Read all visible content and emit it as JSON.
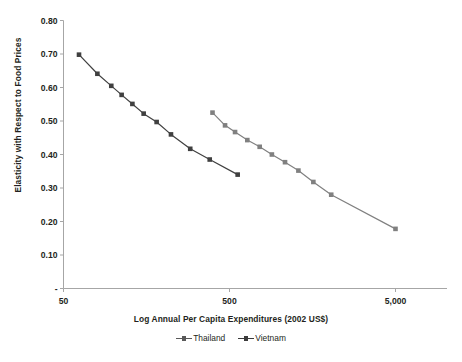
{
  "chart_data": {
    "type": "line",
    "title": "",
    "xlabel": "Log Annual Per Capita Expenditures (2002 US$)",
    "ylabel": "Elasticity with Respect to Food Prices",
    "xscale": "log",
    "xlim": [
      50,
      7000
    ],
    "ylim": [
      0,
      0.8
    ],
    "xticks": [
      50,
      500,
      5000
    ],
    "xticklabels": [
      "50",
      "500",
      "5,000"
    ],
    "yticks": [
      0,
      0.1,
      0.2,
      0.3,
      0.4,
      0.5,
      0.6,
      0.7,
      0.8
    ],
    "yticklabels": [
      "-",
      "0.10",
      "0.20",
      "0.30",
      "0.40",
      "0.50",
      "0.60",
      "0.70",
      "0.80"
    ],
    "grid": false,
    "legend_position": "bottom",
    "series": [
      {
        "name": "Thailand",
        "color": "#808080",
        "marker": "square",
        "points": [
          {
            "x": 395,
            "y": 0.525
          },
          {
            "x": 470,
            "y": 0.487
          },
          {
            "x": 540,
            "y": 0.467
          },
          {
            "x": 640,
            "y": 0.443
          },
          {
            "x": 760,
            "y": 0.423
          },
          {
            "x": 900,
            "y": 0.4
          },
          {
            "x": 1080,
            "y": 0.377
          },
          {
            "x": 1300,
            "y": 0.352
          },
          {
            "x": 1600,
            "y": 0.318
          },
          {
            "x": 2050,
            "y": 0.28
          },
          {
            "x": 5000,
            "y": 0.178
          }
        ]
      },
      {
        "name": "Vietnam",
        "color": "#404040",
        "marker": "square",
        "points": [
          {
            "x": 62,
            "y": 0.698
          },
          {
            "x": 80,
            "y": 0.641
          },
          {
            "x": 97,
            "y": 0.605
          },
          {
            "x": 112,
            "y": 0.578
          },
          {
            "x": 130,
            "y": 0.551
          },
          {
            "x": 152,
            "y": 0.522
          },
          {
            "x": 182,
            "y": 0.497
          },
          {
            "x": 222,
            "y": 0.46
          },
          {
            "x": 290,
            "y": 0.417
          },
          {
            "x": 380,
            "y": 0.385
          },
          {
            "x": 560,
            "y": 0.34
          }
        ]
      }
    ]
  },
  "legend": {
    "items": [
      {
        "label": "Thailand"
      },
      {
        "label": "Vietnam"
      }
    ]
  },
  "caption": {
    "text": ""
  }
}
